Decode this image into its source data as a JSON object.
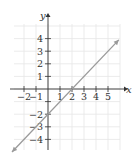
{
  "chart_data": {
    "type": "line",
    "title": "",
    "xlabel": "x",
    "ylabel": "y",
    "xlim": [
      -3,
      6
    ],
    "ylim": [
      -5,
      5
    ],
    "grid": true,
    "x_ticks": [
      -2,
      -1,
      1,
      2,
      3,
      4,
      5
    ],
    "x_tick_labels": [
      "−2",
      "−1",
      "1",
      "2",
      "3",
      "4",
      "5"
    ],
    "y_ticks": [
      4,
      3,
      2,
      1,
      -2,
      -3,
      -4
    ],
    "y_tick_labels": [
      "4",
      "3",
      "2",
      "1",
      "−2",
      "−3",
      "−4"
    ],
    "series": [
      {
        "name": "y = x - 2",
        "equation": "y = x - 2",
        "slope": 1,
        "intercept": -2,
        "x": [
          -3.0,
          5.9
        ],
        "y": [
          -5.0,
          3.9
        ],
        "arrows": "both",
        "color": "#9a9a9a"
      }
    ],
    "intercepts": {
      "x_intercept": [
        2,
        0
      ],
      "y_intercept": [
        0,
        -2
      ]
    }
  },
  "colors": {
    "grid": "#e6e6e6",
    "axis": "#333333",
    "line": "#9a9a9a"
  }
}
